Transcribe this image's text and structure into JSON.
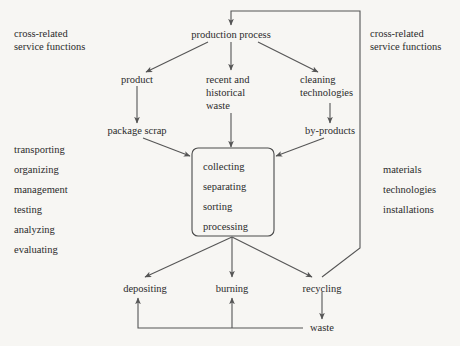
{
  "diagram": {
    "background_color": "#f7f6f3",
    "text_color": "#2b2b2b",
    "line_color": "#555555"
  },
  "left_panel": {
    "heading_line1": "cross-related",
    "heading_line2": "service functions",
    "functions": [
      "transporting",
      "organizing",
      "management",
      "testing",
      "analyzing",
      "evaluating"
    ]
  },
  "right_panel": {
    "heading_line1": "cross-related",
    "heading_line2": "service functions",
    "resources": [
      "materials",
      "technologies",
      "installations"
    ]
  },
  "nodes": {
    "production_process": "production process",
    "product": "product",
    "recent_waste_line1": "recent and",
    "recent_waste_line2": "historical",
    "recent_waste_line3": "waste",
    "cleaning_line1": "cleaning",
    "cleaning_line2": "technologies",
    "package_scrap": "package scrap",
    "by_products": "by-products",
    "depositing": "depositing",
    "burning": "burning",
    "recycling": "recycling",
    "waste": "waste"
  },
  "process_box": {
    "steps": [
      "collecting",
      "separating",
      "sorting",
      "processing"
    ]
  }
}
